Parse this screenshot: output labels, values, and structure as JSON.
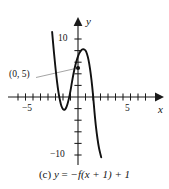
{
  "figure": {
    "caption_prefix": "(c)",
    "caption_lhs": "y",
    "caption_eq": "=",
    "caption_rhs": "−f(x + 1) + 1",
    "caption_full": "(c) y = −f(x + 1) + 1",
    "background_color": "#ffffff",
    "ink_color": "#1a1a1a",
    "curve_color": "#111111",
    "annotation_leader_color": "#8d8d8d"
  },
  "axes": {
    "x_label": "x",
    "y_label": "y",
    "x_tick_labels": [
      "−5",
      "5"
    ],
    "y_tick_labels": [
      "10",
      "−10"
    ],
    "x_range": [
      -6.5,
      6.5
    ],
    "y_range": [
      -12,
      12
    ],
    "x_tick_step": 1,
    "y_tick_step": 2,
    "grid": "off",
    "arrowheads": [
      "x-positive",
      "y-positive"
    ]
  },
  "annotations": [
    {
      "name": "point-label",
      "text": "(0, 5)",
      "points_to": [
        0,
        5
      ],
      "marker": "filled-dot"
    }
  ],
  "chart_data": {
    "type": "line",
    "xlabel": "x",
    "ylabel": "y",
    "xlim": [
      -6.5,
      6.5
    ],
    "ylim": [
      -12,
      12
    ],
    "grid": false,
    "legend": "none",
    "xticks": [
      -6,
      -5,
      -4,
      -3,
      -2,
      -1,
      0,
      1,
      2,
      3,
      4,
      5,
      6
    ],
    "xtick_labels": {
      "-5": "−5",
      "5": "5"
    },
    "yticks": [
      -10,
      -8,
      -6,
      -4,
      -2,
      0,
      2,
      4,
      6,
      8,
      10
    ],
    "ytick_labels": {
      "10": "10",
      "-10": "−10"
    },
    "series": [
      {
        "name": "y = -f(x + 1) + 1",
        "shape": "cubic",
        "x": [
          -3.45,
          -3.2,
          -3.0,
          -2.8,
          -2.6,
          -2.4,
          -2.2,
          -2.0,
          -1.8,
          -1.6,
          -1.4,
          -1.2,
          -1.0,
          -0.8,
          -0.6,
          -0.4,
          -0.2,
          0.0,
          0.2,
          0.4,
          0.6,
          0.8,
          1.0,
          1.2,
          1.4,
          1.6,
          1.8,
          2.0,
          2.2,
          2.4,
          2.6,
          2.8,
          3.0,
          3.1
        ],
        "values": [
          11.2,
          7.6,
          5.0,
          2.7,
          0.8,
          -0.6,
          -1.6,
          -2.1,
          -2.2,
          -1.9,
          -1.2,
          -0.2,
          1.1,
          2.6,
          4.0,
          5.2,
          6.2,
          7.0,
          7.6,
          8.0,
          8.2,
          8.2,
          8.0,
          7.4,
          6.4,
          4.9,
          2.9,
          0.4,
          -2.6,
          -5.2,
          -7.2,
          -8.8,
          -9.9,
          -10.4
        ]
      }
    ],
    "marked_points": [
      {
        "x": 0,
        "y": 5,
        "label": "(0, 5)"
      }
    ],
    "local_extrema": [
      {
        "type": "local-min",
        "x": -1.9,
        "y": -2.2
      },
      {
        "type": "local-max",
        "x": 0.7,
        "y": 8.2
      }
    ],
    "x_intercepts": [
      -2.9,
      -1.05,
      2.1
    ]
  }
}
